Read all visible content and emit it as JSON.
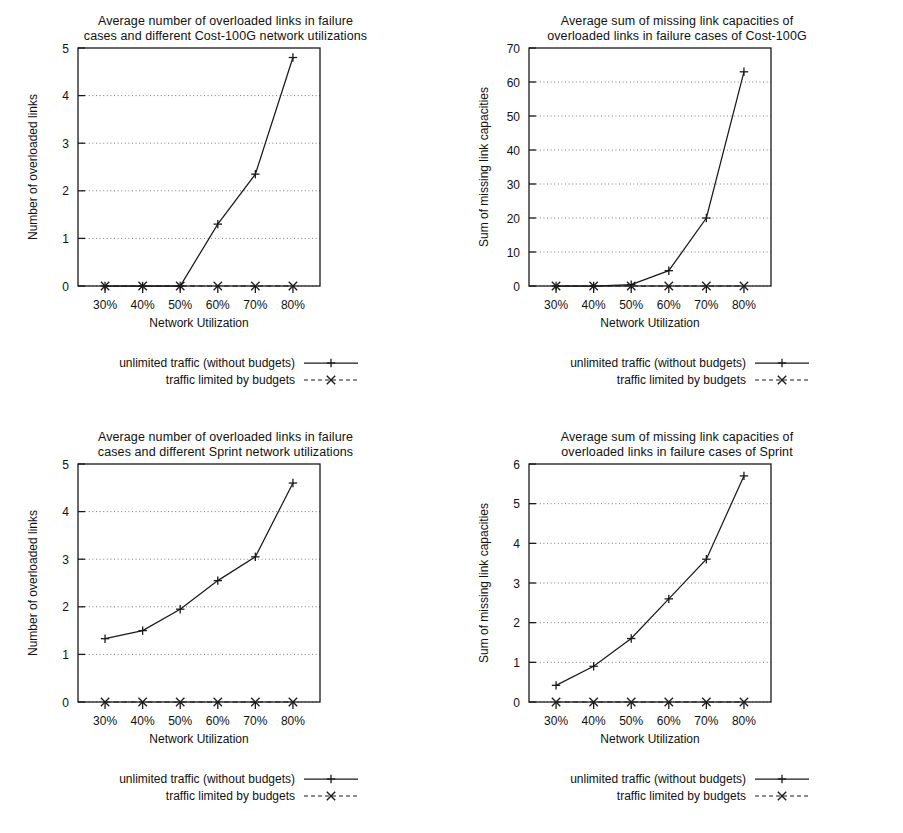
{
  "figure": {
    "legend": {
      "series1_label": "unlimited traffic (without budgets)",
      "series2_label": "traffic limited by budgets",
      "series1_marker": "plus-marker",
      "series2_marker": "cross-marker"
    },
    "axis_color": "#1a1a1a",
    "grid_color": "#6e6e6e",
    "background": "#ffffff"
  },
  "chart_data": [
    {
      "id": "cost100g-overloaded-links",
      "type": "line",
      "title": "Average number of overloaded links in failure\ncases and different Cost-100G network utilizations",
      "title_line1": "Average number of overloaded links in failure",
      "title_line2": "cases and different Cost-100G network utilizations",
      "xlabel": "Network Utilization",
      "ylabel": "Number of overloaded links",
      "categories": [
        "30%",
        "40%",
        "50%",
        "60%",
        "70%",
        "80%"
      ],
      "xticklabels": [
        "30%",
        "40%",
        "50%",
        "60%",
        "70%",
        "80%"
      ],
      "yticklabels": [
        "0",
        "1",
        "2",
        "3",
        "4",
        "5"
      ],
      "ylim": [
        0,
        5
      ],
      "ytick_values": [
        0,
        1,
        2,
        3,
        4,
        5
      ],
      "grid": true,
      "legend_position": "below",
      "series": [
        {
          "name": "unlimited traffic (without budgets)",
          "style": "solid",
          "marker": "plus",
          "values": [
            0,
            0,
            0,
            1.3,
            2.35,
            4.8
          ]
        },
        {
          "name": "traffic limited by budgets",
          "style": "dashed",
          "marker": "cross",
          "values": [
            0,
            0,
            0,
            0,
            0,
            0
          ]
        }
      ]
    },
    {
      "id": "cost100g-missing-capacities",
      "type": "line",
      "title": "Average sum of missing link capacities of\noverloaded links in failure cases of Cost-100G",
      "title_line1": "Average sum of missing link capacities of",
      "title_line2": "overloaded links in failure cases of Cost-100G",
      "xlabel": "Network Utilization",
      "ylabel": "Sum of missing link capacities",
      "categories": [
        "30%",
        "40%",
        "50%",
        "60%",
        "70%",
        "80%"
      ],
      "xticklabels": [
        "30%",
        "40%",
        "50%",
        "60%",
        "70%",
        "80%"
      ],
      "yticklabels": [
        "0",
        "10",
        "20",
        "30",
        "40",
        "50",
        "60",
        "70"
      ],
      "ylim": [
        0,
        70
      ],
      "ytick_values": [
        0,
        10,
        20,
        30,
        40,
        50,
        60,
        70
      ],
      "grid": true,
      "legend_position": "below",
      "series": [
        {
          "name": "unlimited traffic (without budgets)",
          "style": "solid",
          "marker": "plus",
          "values": [
            0,
            0,
            0.4,
            4.5,
            20,
            63
          ]
        },
        {
          "name": "traffic limited by budgets",
          "style": "dashed",
          "marker": "cross",
          "values": [
            0,
            0,
            0,
            0,
            0,
            0
          ]
        }
      ]
    },
    {
      "id": "sprint-overloaded-links",
      "type": "line",
      "title": "Average number of overloaded links in failure\ncases and different Sprint network utilizations",
      "title_line1": "Average number of overloaded links in failure",
      "title_line2": "cases and different Sprint network utilizations",
      "xlabel": "Network Utilization",
      "ylabel": "Number of overloaded links",
      "categories": [
        "30%",
        "40%",
        "50%",
        "60%",
        "70%",
        "80%"
      ],
      "xticklabels": [
        "30%",
        "40%",
        "50%",
        "60%",
        "70%",
        "80%"
      ],
      "yticklabels": [
        "0",
        "1",
        "2",
        "3",
        "4",
        "5"
      ],
      "ylim": [
        0,
        5
      ],
      "ytick_values": [
        0,
        1,
        2,
        3,
        4,
        5
      ],
      "grid": true,
      "legend_position": "below",
      "series": [
        {
          "name": "unlimited traffic (without budgets)",
          "style": "solid",
          "marker": "plus",
          "values": [
            1.33,
            1.5,
            1.95,
            2.55,
            3.05,
            4.6
          ]
        },
        {
          "name": "traffic limited by budgets",
          "style": "dashed",
          "marker": "cross",
          "values": [
            0,
            0,
            0,
            0,
            0,
            0
          ]
        }
      ]
    },
    {
      "id": "sprint-missing-capacities",
      "type": "line",
      "title": "Average sum of missing link capacities of\noverloaded links in failure cases of Sprint",
      "title_line1": "Average sum of missing link capacities of",
      "title_line2": "overloaded links in failure cases of Sprint",
      "xlabel": "Network Utilization",
      "ylabel": "Sum of missing link capacities",
      "categories": [
        "30%",
        "40%",
        "50%",
        "60%",
        "70%",
        "80%"
      ],
      "xticklabels": [
        "30%",
        "40%",
        "50%",
        "60%",
        "70%",
        "80%"
      ],
      "yticklabels": [
        "0",
        "1",
        "2",
        "3",
        "4",
        "5",
        "6"
      ],
      "ylim": [
        0,
        6
      ],
      "ytick_values": [
        0,
        1,
        2,
        3,
        4,
        5,
        6
      ],
      "grid": true,
      "legend_position": "below",
      "series": [
        {
          "name": "unlimited traffic (without budgets)",
          "style": "solid",
          "marker": "plus",
          "values": [
            0.42,
            0.9,
            1.6,
            2.6,
            3.6,
            5.7
          ]
        },
        {
          "name": "traffic limited by budgets",
          "style": "dashed",
          "marker": "cross",
          "values": [
            0,
            0,
            0,
            0,
            0,
            0
          ]
        }
      ]
    }
  ]
}
